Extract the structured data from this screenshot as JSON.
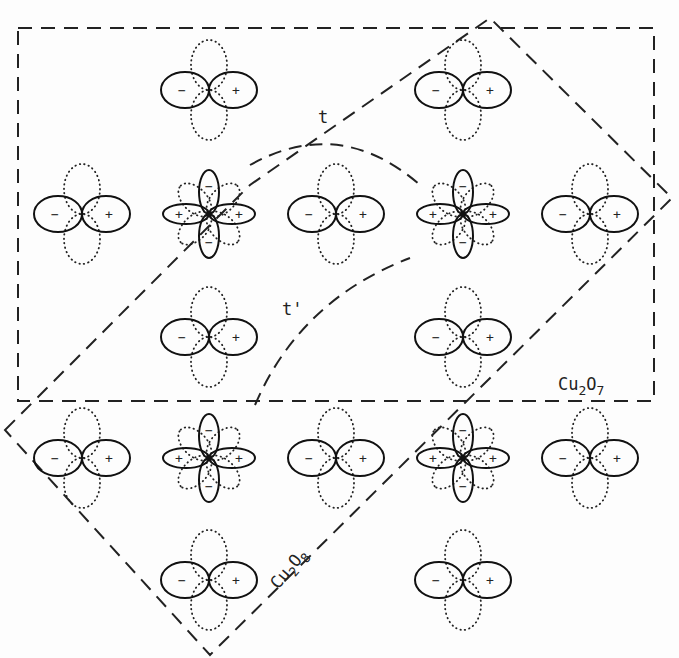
{
  "labels": {
    "hop_t": "t",
    "hop_t_prime": "t'",
    "cell_cu2o7": {
      "base": "Cu",
      "sub1": "2",
      "mid": "O",
      "sub2": "7"
    },
    "cell_cu2o8": {
      "base": "Cu",
      "sub1": "2",
      "mid": "O",
      "sub2": "8"
    }
  },
  "signs": {
    "plus": "+",
    "minus": "−"
  },
  "lattice": {
    "description": "CuO2 plane orbital diagram: Cu d(x2-y2) orbitals surrounded by O p-orbitals",
    "p_orbitals_grid": [
      {
        "row": 0,
        "col": 1
      },
      {
        "row": 0,
        "col": 3
      },
      {
        "row": 1,
        "col": 0
      },
      {
        "row": 1,
        "col": 2
      },
      {
        "row": 1,
        "col": 4
      },
      {
        "row": 2,
        "col": 1
      },
      {
        "row": 2,
        "col": 3
      },
      {
        "row": 3,
        "col": 0
      },
      {
        "row": 3,
        "col": 2
      },
      {
        "row": 3,
        "col": 4
      },
      {
        "row": 4,
        "col": 1
      },
      {
        "row": 4,
        "col": 3
      }
    ],
    "d_orbitals_grid": [
      {
        "row": 1,
        "col": 1
      },
      {
        "row": 1,
        "col": 3
      },
      {
        "row": 3,
        "col": 1
      },
      {
        "row": 3,
        "col": 3
      }
    ]
  }
}
